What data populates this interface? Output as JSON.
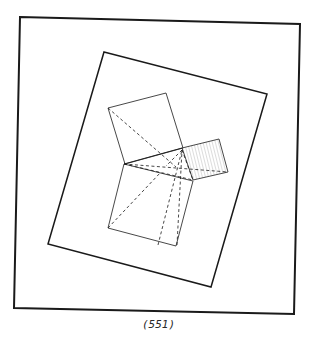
{
  "figure": {
    "caption": "(551)",
    "stroke_color": "#1a1a1a",
    "hatch_color": "#9a9a9a",
    "outer_frame": [
      [
        20,
        17
      ],
      [
        300,
        24
      ],
      [
        294,
        314
      ],
      [
        14,
        308
      ]
    ],
    "tilted_square": [
      [
        104,
        52
      ],
      [
        267,
        94
      ],
      [
        211,
        287
      ],
      [
        48,
        244
      ]
    ],
    "upper_square": [
      [
        108,
        108
      ],
      [
        166,
        93
      ],
      [
        183,
        148
      ],
      [
        125,
        164
      ]
    ],
    "lower_square": [
      [
        124,
        164
      ],
      [
        193,
        181
      ],
      [
        176,
        246
      ],
      [
        108,
        228
      ]
    ],
    "small_square": [
      [
        182,
        148
      ],
      [
        219,
        139
      ],
      [
        228,
        172
      ],
      [
        193,
        180
      ]
    ],
    "solid_lines": [
      [
        [
          124,
          164
        ],
        [
          182,
          148
        ]
      ]
    ],
    "dashed_lines": [
      [
        [
          108,
          108
        ],
        [
          176,
          167
        ]
      ],
      [
        [
          124,
          164
        ],
        [
          228,
          172
        ]
      ],
      [
        [
          124,
          164
        ],
        [
          193,
          180
        ]
      ],
      [
        [
          108,
          228
        ],
        [
          161,
          172
        ]
      ],
      [
        [
          158,
          245
        ],
        [
          182,
          150
        ]
      ],
      [
        [
          177,
          245
        ],
        [
          182,
          150
        ]
      ],
      [
        [
          182,
          150
        ],
        [
          166,
          166
        ]
      ],
      [
        [
          182,
          150
        ],
        [
          193,
          180
        ]
      ]
    ]
  }
}
